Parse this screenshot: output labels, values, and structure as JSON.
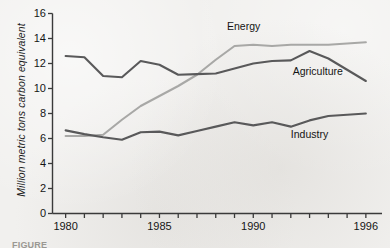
{
  "figure": {
    "background_color": "#f1f0ee",
    "caption_fragment": "FIGURE"
  },
  "chart_data": {
    "type": "line",
    "title": "",
    "xlabel": "",
    "ylabel": "Million metric tons carbon equivalent",
    "xlim": [
      1979.3,
      1996.7
    ],
    "ylim": [
      0,
      16
    ],
    "yticks": [
      0,
      2,
      4,
      6,
      8,
      10,
      12,
      14,
      16
    ],
    "ytick_labels": [
      "0",
      "2",
      "4",
      "6",
      "8",
      "10",
      "12",
      "14",
      "16"
    ],
    "xticks": [
      1980,
      1981,
      1982,
      1983,
      1984,
      1985,
      1986,
      1987,
      1988,
      1989,
      1990,
      1991,
      1992,
      1993,
      1994,
      1995,
      1996
    ],
    "xtick_labels_shown": [
      "1980",
      "1985",
      "1990",
      "1996"
    ],
    "xtick_labels_shown_values": [
      1980,
      1985,
      1990,
      1996
    ],
    "grid": false,
    "legend_position": "inline-annotations",
    "x": [
      1980,
      1981,
      1982,
      1983,
      1984,
      1985,
      1986,
      1987,
      1988,
      1989,
      1990,
      1991,
      1992,
      1993,
      1994,
      1995,
      1996
    ],
    "series": [
      {
        "name": "Energy",
        "color": "#a8a8a6",
        "values": [
          6.2,
          6.2,
          6.3,
          7.5,
          8.6,
          9.4,
          10.2,
          11.1,
          12.3,
          13.4,
          13.5,
          13.4,
          13.5,
          13.5,
          13.5,
          13.6,
          13.7
        ],
        "label": "Energy",
        "label_x": 1988.6,
        "label_y": 14.9
      },
      {
        "name": "Agriculture",
        "color": "#59595a",
        "values": [
          12.6,
          12.5,
          11.0,
          10.9,
          12.2,
          11.9,
          11.1,
          11.15,
          11.2,
          11.6,
          12.0,
          12.2,
          12.25,
          13.0,
          12.4,
          11.5,
          10.6
        ],
        "label": "Agriculture",
        "label_x": 1992.1,
        "label_y": 11.35
      },
      {
        "name": "Industry",
        "color": "#59595a",
        "values": [
          6.65,
          6.35,
          6.1,
          5.9,
          6.5,
          6.55,
          6.25,
          6.6,
          6.95,
          7.3,
          7.05,
          7.3,
          6.95,
          7.45,
          7.8,
          7.9,
          8.0
        ],
        "label": "Industry",
        "label_x": 1992.0,
        "label_y": 6.25
      }
    ]
  },
  "axis": {
    "y_title": "Million metric tons carbon equivalent"
  }
}
